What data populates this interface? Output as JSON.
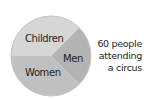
{
  "chart_data": {
    "type": "pie",
    "title": "60 people attending a circus",
    "total": 60,
    "categories": [
      "Children",
      "Men",
      "Women"
    ],
    "values": [
      22.5,
      15,
      22.5
    ],
    "angles_deg": [
      135,
      90,
      135
    ],
    "colors": [
      "#d6d6d6",
      "#b3b3b3",
      "#c0c0c0"
    ],
    "start_angle_deg": 270,
    "direction": "clockwise",
    "legend": "labels on slices"
  },
  "caption_lines": [
    "60 people",
    "attending",
    "a circus"
  ],
  "labels": {
    "children": "Children",
    "men": "Men",
    "women": "Women"
  }
}
